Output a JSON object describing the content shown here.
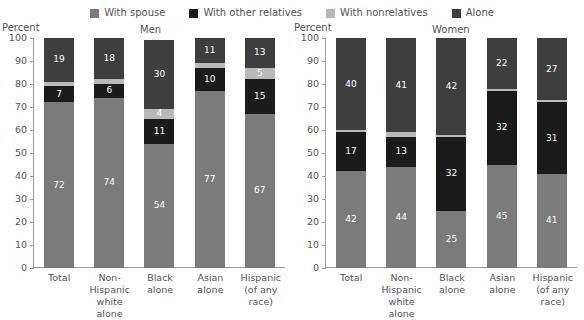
{
  "legend": {
    "items": [
      {
        "label": "With spouse",
        "color": "#7b7b7b",
        "key": "with_spouse"
      },
      {
        "label": "With other relatives",
        "color": "#1b1b1b",
        "key": "with_other_relatives"
      },
      {
        "label": "With nonrelatives",
        "color": "#b9b9b9",
        "key": "with_nonrelatives"
      },
      {
        "label": "Alone",
        "color": "#3e3e3e",
        "key": "alone"
      }
    ]
  },
  "axis": {
    "percent_label": "Percent",
    "ticks": [
      0,
      10,
      20,
      30,
      40,
      50,
      60,
      70,
      80,
      90,
      100
    ]
  },
  "panels": [
    {
      "title": "Men",
      "percent_label": "Percent"
    },
    {
      "title": "Women",
      "percent_label": "Percent"
    }
  ],
  "categories_display": [
    [
      "Total"
    ],
    [
      "Non-Hispanic",
      "white alone"
    ],
    [
      "Black",
      "alone"
    ],
    [
      "Asian",
      "alone"
    ],
    [
      "Hispanic",
      "(of any race)"
    ]
  ],
  "chart_data": [
    {
      "type": "bar",
      "title": "Men",
      "stacked": true,
      "xlabel": "",
      "ylabel": "Percent",
      "ylim": [
        0,
        100
      ],
      "yticks": [
        0,
        10,
        20,
        30,
        40,
        50,
        60,
        70,
        80,
        90,
        100
      ],
      "grid": false,
      "legend_position": "top",
      "categories": [
        "Total",
        "Non-Hispanic white alone",
        "Black alone",
        "Asian alone",
        "Hispanic (of any race)"
      ],
      "series": [
        {
          "name": "With spouse",
          "color": "#7b7b7b",
          "values": [
            72,
            74,
            54,
            77,
            67
          ],
          "labels": [
            "72",
            "74",
            "54",
            "77",
            "67"
          ]
        },
        {
          "name": "With other relatives",
          "color": "#1b1b1b",
          "values": [
            7,
            6,
            11,
            10,
            15
          ],
          "labels": [
            "7",
            "6",
            "11",
            "10",
            "15"
          ]
        },
        {
          "name": "With nonrelatives",
          "color": "#b9b9b9",
          "values": [
            2,
            2,
            4,
            2,
            5
          ],
          "labels": [
            "",
            "",
            "4",
            "",
            "5"
          ]
        },
        {
          "name": "Alone",
          "color": "#3e3e3e",
          "values": [
            19,
            18,
            30,
            11,
            13
          ],
          "labels": [
            "19",
            "18",
            "30",
            "11",
            "13"
          ]
        }
      ]
    },
    {
      "type": "bar",
      "title": "Women",
      "stacked": true,
      "xlabel": "",
      "ylabel": "Percent",
      "ylim": [
        0,
        100
      ],
      "yticks": [
        0,
        10,
        20,
        30,
        40,
        50,
        60,
        70,
        80,
        90,
        100
      ],
      "grid": false,
      "legend_position": "top",
      "categories": [
        "Total",
        "Non-Hispanic white alone",
        "Black alone",
        "Asian alone",
        "Hispanic (of any race)"
      ],
      "series": [
        {
          "name": "With spouse",
          "color": "#7b7b7b",
          "values": [
            42,
            44,
            25,
            45,
            41
          ],
          "labels": [
            "42",
            "44",
            "25",
            "45",
            "41"
          ]
        },
        {
          "name": "With other relatives",
          "color": "#1b1b1b",
          "values": [
            17,
            13,
            32,
            32,
            31
          ],
          "labels": [
            "17",
            "13",
            "32",
            "32",
            "31"
          ]
        },
        {
          "name": "With nonrelatives",
          "color": "#b9b9b9",
          "values": [
            1,
            2,
            1,
            1,
            1
          ],
          "labels": [
            "",
            "",
            "",
            "",
            ""
          ]
        },
        {
          "name": "Alone",
          "color": "#3e3e3e",
          "values": [
            40,
            41,
            42,
            22,
            27
          ],
          "labels": [
            "40",
            "41",
            "42",
            "22",
            "27"
          ]
        }
      ]
    }
  ]
}
